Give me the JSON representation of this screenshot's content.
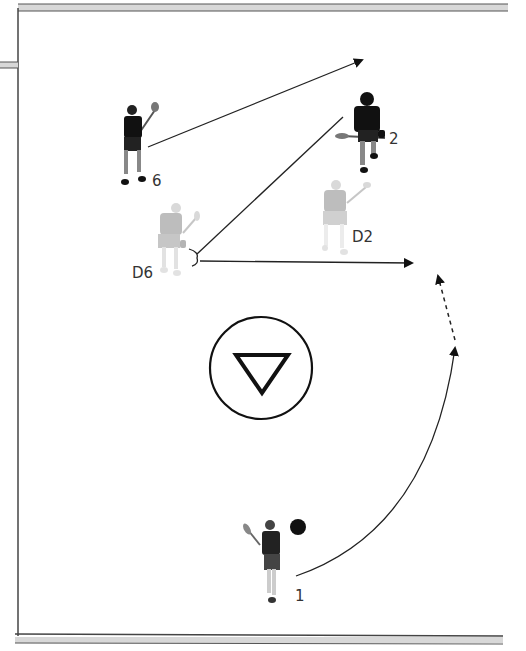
{
  "diagram": {
    "type": "lacrosse-play",
    "colors": {
      "offense": "#111111",
      "defense": "#a9a9a9",
      "line": "#222222",
      "border_fill": "#d8d8d8",
      "border_line": "#555555"
    },
    "players": [
      {
        "id": "6",
        "label": "6",
        "team": "offense",
        "x": 133,
        "y": 145
      },
      {
        "id": "2",
        "label": "2",
        "team": "offense",
        "x": 368,
        "y": 135
      },
      {
        "id": "D6",
        "label": "D6",
        "team": "defense",
        "x": 170,
        "y": 237
      },
      {
        "id": "D2",
        "label": "D2",
        "team": "defense",
        "x": 335,
        "y": 218
      },
      {
        "id": "1",
        "label": "1",
        "team": "offense",
        "x": 270,
        "y": 560
      }
    ],
    "ball": {
      "x": 298,
      "y": 527,
      "r": 8
    },
    "goal_crease": {
      "cx": 261,
      "cy": 368,
      "r": 51,
      "symbol": "triangle-down"
    },
    "arrows": [
      {
        "from": "6",
        "to": [
          362,
          60
        ],
        "style": "solid"
      },
      {
        "from": "D6",
        "to": [
          343,
          116
        ],
        "style": "solid",
        "head": false
      },
      {
        "from": "D6",
        "to": [
          412,
          263
        ],
        "style": "solid"
      },
      {
        "from": "1",
        "to": [
          455,
          348
        ],
        "style": "solid-curve"
      },
      {
        "from": [
          455,
          348
        ],
        "to": [
          436,
          275
        ],
        "style": "dashed"
      }
    ]
  }
}
